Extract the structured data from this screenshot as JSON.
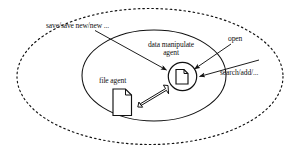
{
  "diagram": {
    "background_color": "#ffffff",
    "stroke_color": "#111111",
    "shapes": {
      "outer_boundary": {
        "name": "outer-dashed-ellipse",
        "style": "dashed"
      },
      "inner_boundary": {
        "name": "inner-solid-ellipse",
        "style": "solid"
      },
      "agent_circle": {
        "name": "data-manipulate-agent-circle",
        "style": "solid"
      },
      "agent_doc_icon": "document-icon",
      "file_doc_icon": "document-icon"
    },
    "labels": {
      "save": "save/save new/new ...",
      "data_manipulate_agent_line1": "data manipulate",
      "data_manipulate_agent_line2": "agent",
      "open": "open",
      "search_add": "search/add/...",
      "file_agent": "file agent"
    },
    "connectors": [
      {
        "name": "save-arrow",
        "from": "save-label",
        "to": "data-manipulate-agent",
        "style": "thin-arrow"
      },
      {
        "name": "open-arrow",
        "from": "open-label",
        "to": "data-manipulate-agent",
        "style": "thin-arrow"
      },
      {
        "name": "search-add-arrow",
        "from": "search-add-label",
        "to": "data-manipulate-agent",
        "style": "thin-arrow"
      },
      {
        "name": "file-agent-link",
        "from": "data-manipulate-agent",
        "to": "file-agent",
        "style": "hollow-double-line-arrow"
      }
    ]
  }
}
